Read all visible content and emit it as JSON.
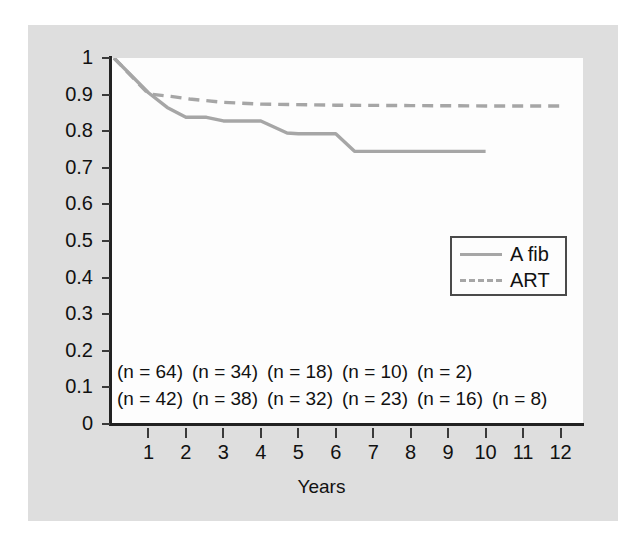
{
  "chart_data": {
    "type": "line",
    "title": "",
    "xlabel": "Years",
    "ylabel": "",
    "xlim": [
      0,
      12.6
    ],
    "ylim": [
      0,
      1
    ],
    "grid": false,
    "legend_position": "right-middle",
    "x_tick_labels": [
      "1",
      "2",
      "3",
      "4",
      "5",
      "6",
      "7",
      "8",
      "9",
      "10",
      "11",
      "12"
    ],
    "x_tick_values": [
      1,
      2,
      3,
      4,
      5,
      6,
      7,
      8,
      9,
      10,
      11,
      12
    ],
    "y_tick_labels": [
      "1",
      "0.9",
      "0.8",
      "0.7",
      "0.6",
      "0.5",
      "0.4",
      "0.3",
      "0.2",
      "0.1",
      "0"
    ],
    "y_tick_values": [
      1,
      0.9,
      0.8,
      0.7,
      0.6,
      0.5,
      0.4,
      0.3,
      0.2,
      0.1,
      0
    ],
    "series": [
      {
        "name": "A fib",
        "style": "solid",
        "color": "#a6a6a6",
        "x": [
          0.08,
          1.0,
          1.5,
          2.0,
          2.55,
          3.0,
          4.0,
          4.7,
          5.0,
          6.0,
          6.5,
          10.0
        ],
        "y": [
          1.0,
          0.905,
          0.865,
          0.838,
          0.838,
          0.828,
          0.828,
          0.795,
          0.793,
          0.793,
          0.745,
          0.745
        ]
      },
      {
        "name": "ART",
        "style": "dashed",
        "color": "#a6a6a6",
        "x": [
          0.08,
          1.0,
          1.6,
          2.1,
          3.0,
          4.0,
          6.0,
          8.0,
          10.0,
          12.1
        ],
        "y": [
          1.0,
          0.902,
          0.895,
          0.888,
          0.879,
          0.874,
          0.871,
          0.87,
          0.869,
          0.869
        ]
      }
    ],
    "annotations": {
      "row_afib": [
        "(n = 64)",
        "(n = 34)",
        "(n = 18)",
        "(n = 10)",
        "(n = 2)"
      ],
      "row_art": [
        "(n = 42)",
        "(n = 38)",
        "(n = 32)",
        "(n = 23)",
        "(n = 16)",
        "(n = 8)"
      ]
    }
  },
  "legend": {
    "entries": [
      {
        "label": "A fib",
        "style": "solid"
      },
      {
        "label": "ART",
        "style": "dashed"
      }
    ]
  },
  "axes": {
    "x_title": "Years"
  },
  "colors": {
    "series_line": "#a6a6a6",
    "axis": "#222222",
    "panel_background": "#dedede",
    "plot_background": "#fdfdfd",
    "text": "#111111"
  }
}
